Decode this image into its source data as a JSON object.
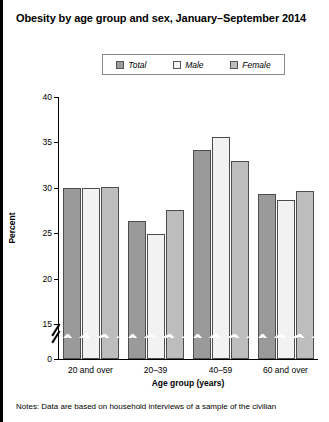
{
  "title": "Obesity by age group and sex, January–September 2014",
  "notes": "Notes: Data are based on household interviews of a sample of the civilian",
  "legend": {
    "items": [
      {
        "label": "Total",
        "key": "total",
        "color": "#9a9a9a"
      },
      {
        "label": "Male",
        "key": "male",
        "color": "#f2f2f2"
      },
      {
        "label": "Female",
        "key": "female",
        "color": "#bdbdbd"
      }
    ]
  },
  "axis": {
    "ylabel": "Percent",
    "xlabel": "Age group (years)",
    "yticks": [
      "0",
      "15",
      "20",
      "25",
      "30",
      "35",
      "40"
    ]
  },
  "chart_data": {
    "type": "bar",
    "title": "Obesity by age group and sex, January–September 2014",
    "xlabel": "Age group (years)",
    "ylabel": "Percent",
    "categories": [
      "20 and over",
      "20–39",
      "40–59",
      "60 and over"
    ],
    "series": [
      {
        "name": "Total",
        "values": [
          30.0,
          26.3,
          34.2,
          29.3
        ]
      },
      {
        "name": "Male",
        "values": [
          30.0,
          24.9,
          35.6,
          28.7
        ]
      },
      {
        "name": "Female",
        "values": [
          30.1,
          27.6,
          32.9,
          29.6
        ]
      }
    ],
    "ylim": [
      0,
      40
    ],
    "ytick_values": [
      0,
      15,
      20,
      25,
      30,
      35,
      40
    ],
    "axis_break": {
      "from": 0,
      "to": 15,
      "style": "zigzag"
    },
    "grid": false,
    "legend_position": "top-center"
  }
}
